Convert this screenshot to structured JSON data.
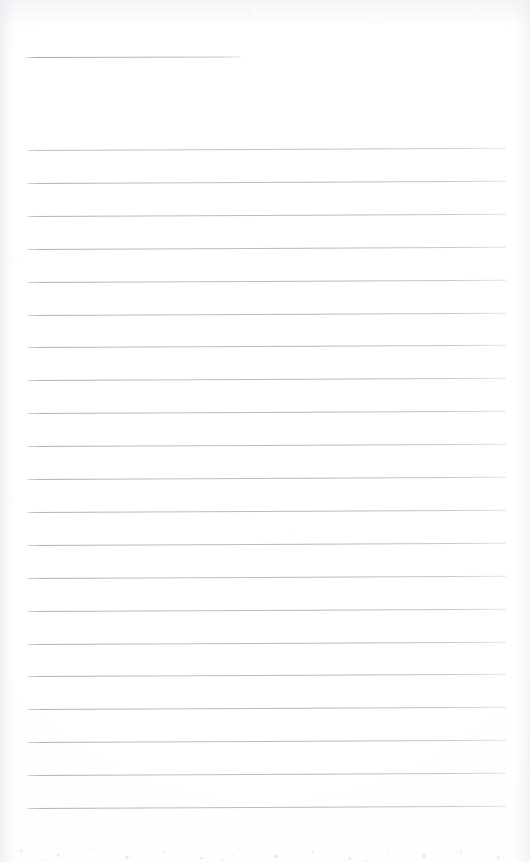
{
  "document": {
    "kind": "scanned-lined-paper",
    "title": "Blank ruled notebook page (scan)",
    "page_label": "",
    "width_px": 530,
    "height_px": 862,
    "background_color": "#ffffff",
    "rule_color": "#aeb3bb",
    "written_text": "",
    "notes_text": ""
  },
  "rules": {
    "short_rule": {
      "label": "short top rule",
      "x": 25,
      "y": 57,
      "width": 216,
      "tilt_deg": -0.12
    },
    "full_rules": {
      "label": "full-width ruled lines",
      "count": 21,
      "first_y": 150,
      "spacing": 32.9,
      "x": 27,
      "width": 479,
      "tilt_deg": -0.28
    }
  }
}
